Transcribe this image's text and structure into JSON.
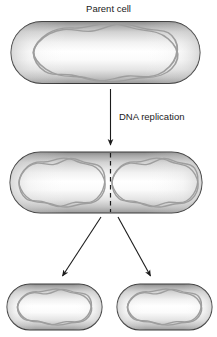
{
  "figure": {
    "background_color": "#ffffff"
  },
  "labels": {
    "parent_cell": "Parent cell",
    "dna_replication": "DNA replication"
  },
  "colors": {
    "cell_outline": "#333333",
    "cell_fill_edge": "#8e8e8e",
    "cell_fill_center": "#ffffff",
    "dna_stroke": "#9a9a9a",
    "arrow": "#1b1b1b",
    "division_line": "#1b1b1b",
    "text": "#1b1b1b"
  },
  "stages": [
    {
      "name": "parent-cell",
      "label": "Parent cell",
      "dna_loops": 1,
      "division_line": false
    },
    {
      "name": "replicated-cell",
      "label": "",
      "dna_loops": 2,
      "division_line": true
    },
    {
      "name": "daughter-cell-left",
      "label": "",
      "dna_loops": 1,
      "division_line": false
    },
    {
      "name": "daughter-cell-right",
      "label": "",
      "dna_loops": 1,
      "division_line": false
    }
  ],
  "arrows": [
    {
      "name": "replication-arrow",
      "direction": "down",
      "label": "DNA replication"
    },
    {
      "name": "split-arrow-left",
      "direction": "down-left",
      "label": ""
    },
    {
      "name": "split-arrow-right",
      "direction": "down-right",
      "label": ""
    }
  ]
}
